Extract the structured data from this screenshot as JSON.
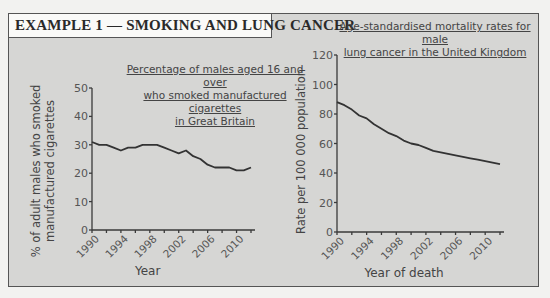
{
  "header": {
    "title": "EXAMPLE 1 — SMOKING AND LUNG CANCER"
  },
  "chart_data": [
    {
      "type": "line",
      "title": "Percentage of males aged 16 and over who smoked manufactured cigarettes in Great Britain",
      "title_lines": [
        "Percentage of males aged 16 and over",
        "who smoked manufactured cigarettes",
        "in Great Britain"
      ],
      "xlabel": "Year",
      "ylabel": "% of adult males who smoked manufactured cigarettes",
      "ylabel_lines": [
        "% of adult males who smoked",
        "manufactured cigarettes"
      ],
      "ylim": [
        0,
        50
      ],
      "yticks": [
        0,
        10,
        20,
        30,
        40,
        50
      ],
      "xtick_labels": [
        "1990",
        "1994",
        "1998",
        "2002",
        "2006",
        "2010"
      ],
      "x": [
        1990,
        1991,
        1992,
        1993,
        1994,
        1995,
        1996,
        1997,
        1998,
        1999,
        2000,
        2001,
        2002,
        2003,
        2004,
        2005,
        2006,
        2007,
        2008,
        2009,
        2010,
        2011,
        2012
      ],
      "values": [
        31,
        30,
        30,
        29,
        28,
        29,
        29,
        30,
        30,
        30,
        29,
        28,
        27,
        28,
        26,
        25,
        23,
        22,
        22,
        22,
        21,
        21,
        22
      ],
      "grid": false
    },
    {
      "type": "line",
      "title": "Age-standardised mortality rates for male lung cancer in the United Kingdom",
      "title_lines": [
        "Age-standardised mortality rates for male",
        "lung cancer in the United Kingdom"
      ],
      "xlabel": "Year of death",
      "ylabel": "Rate per 100 000 population",
      "ylim": [
        0,
        120
      ],
      "yticks": [
        0,
        20,
        40,
        60,
        80,
        100,
        120
      ],
      "xtick_labels": [
        "1990",
        "1994",
        "1998",
        "2002",
        "2006",
        "2010"
      ],
      "x": [
        1990,
        1991,
        1992,
        1993,
        1994,
        1995,
        1996,
        1997,
        1998,
        1999,
        2000,
        2001,
        2002,
        2003,
        2004,
        2005,
        2006,
        2007,
        2008,
        2009,
        2010,
        2011,
        2012
      ],
      "values": [
        88,
        86,
        83,
        79,
        77,
        73,
        70,
        67,
        65,
        62,
        60,
        59,
        57,
        55,
        54,
        53,
        52,
        51,
        50,
        49,
        48,
        47,
        46
      ],
      "grid": false
    }
  ]
}
